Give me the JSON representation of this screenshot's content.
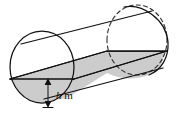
{
  "figure": {
    "name": "cylindrical-tank-partially-filled",
    "background_color": "#ffffff",
    "outline_color": "#111111",
    "hidden_edge_color": "#2a2a2a",
    "fill_color": "#cccccc",
    "unfilled_color": "#ffffff",
    "labels": {
      "depth_variable": "h",
      "depth_unit": "m",
      "depth_full": "h m"
    },
    "annotations": {
      "depth_arrow": {
        "name": "depth-dimension-arrow",
        "style": "double-headed-vertical",
        "x": 48,
        "y_top": 79,
        "y_bottom": 106
      },
      "label_position": {
        "x": 55,
        "y": 95
      }
    },
    "geometry": {
      "front_face": {
        "name": "near-circular-end",
        "cx": 42,
        "cy": 67,
        "rx": 32,
        "ry": 36
      },
      "back_face": {
        "name": "far-circular-end",
        "cx": 137,
        "cy": 40,
        "rx": 30,
        "ry": 35
      },
      "water_line_front_y": 79,
      "water_line_back_y": 51,
      "top_edge": [
        [
          22,
          38
        ],
        [
          155,
          8
        ]
      ],
      "bottom_edge": [
        [
          38,
          100
        ],
        [
          168,
          68
        ]
      ]
    }
  }
}
